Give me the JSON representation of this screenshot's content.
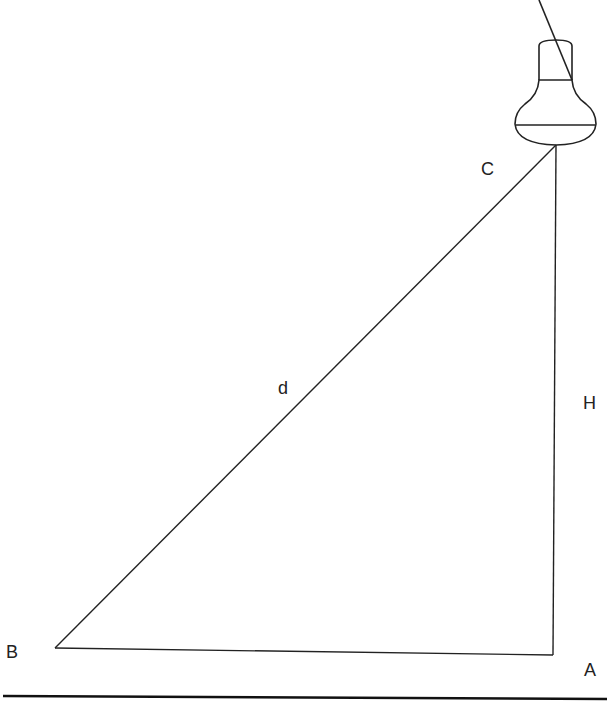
{
  "diagram": {
    "type": "geometry-right-triangle-with-lamp",
    "labels": {
      "C": "C",
      "d": "d",
      "H": "H",
      "B": "B",
      "A": "A"
    },
    "points": {
      "A": [
        553,
        655
      ],
      "B": [
        55,
        648
      ],
      "C": [
        556,
        145
      ]
    },
    "segments": [
      {
        "from": "B",
        "to": "C",
        "label": "d"
      },
      {
        "from": "C",
        "to": "A",
        "label": "H"
      },
      {
        "from": "B",
        "to": "A",
        "label": ""
      }
    ],
    "objects": [
      {
        "name": "light-bulb",
        "position": "above C"
      },
      {
        "name": "ground-line",
        "y": 698
      }
    ],
    "stroke_color": "#222222"
  }
}
